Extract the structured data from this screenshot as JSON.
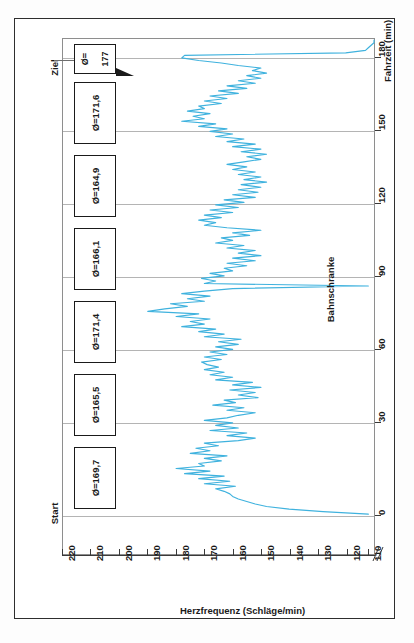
{
  "chart_data": {
    "type": "line",
    "title": "",
    "orientation": "rotated-90ccw",
    "xlabel": "Fahrzeit (min)",
    "ylabel": "Herzfrequenz (Schläge/min)",
    "xlim": [
      0,
      190
    ],
    "ylim": [
      110,
      220
    ],
    "xticks": [
      0,
      30,
      60,
      90,
      120,
      150,
      180
    ],
    "xtick_labels": [
      "0",
      "30",
      "60",
      "90",
      "120",
      "150",
      "180"
    ],
    "yticks": [
      220,
      210,
      200,
      190,
      180,
      170,
      160,
      150,
      140,
      130,
      120,
      110
    ],
    "ytick_labels": [
      "220",
      "210",
      "200",
      "190",
      "180",
      "170",
      "160",
      "150",
      "140",
      "130",
      "120",
      "110"
    ],
    "grid": "on x (Fahrzeit) gridlines only",
    "legend": "none",
    "axis_break": "y-axis broken below 110",
    "series": [
      {
        "name": "Herzfrequenz",
        "color": "#3fb2de",
        "x": [
          0,
          1,
          2,
          3,
          4,
          5,
          6,
          7,
          8,
          9,
          10,
          11,
          12,
          13,
          14,
          15,
          16,
          17,
          18,
          19,
          20,
          21,
          22,
          23,
          24,
          25,
          26,
          27,
          28,
          29,
          30,
          31,
          32,
          33,
          34,
          35,
          36,
          37,
          38,
          39,
          40,
          41,
          42,
          43,
          44,
          45,
          46,
          47,
          48,
          49,
          50,
          51,
          52,
          53,
          54,
          55,
          56,
          57,
          58,
          59,
          60,
          61,
          62,
          63,
          64,
          65,
          66,
          67,
          68,
          69,
          70,
          71,
          72,
          73,
          74,
          75,
          76,
          77,
          78,
          79,
          80,
          81,
          82,
          83,
          84,
          85,
          86,
          87,
          88,
          89,
          90,
          91,
          92,
          93,
          94,
          95,
          96,
          97,
          98,
          99,
          100,
          101,
          102,
          103,
          104,
          105,
          106,
          107,
          108,
          109,
          110,
          111,
          112,
          113,
          114,
          115,
          116,
          117,
          118,
          119,
          120,
          121,
          122,
          123,
          124,
          125,
          126,
          127,
          128,
          129,
          130,
          131,
          132,
          133,
          134,
          135,
          136,
          137,
          138,
          139,
          140,
          141,
          142,
          143,
          144,
          145,
          146,
          147,
          148,
          149,
          150,
          151,
          152,
          153,
          154,
          155,
          156,
          157,
          158,
          159,
          160,
          161,
          162,
          163,
          164,
          165,
          166,
          167,
          168,
          169,
          170,
          171,
          172,
          173,
          174,
          175,
          176,
          177,
          178,
          179,
          180,
          181,
          182,
          183,
          184,
          185,
          186,
          187
        ],
        "values": [
          112,
          128,
          140,
          148,
          152,
          155,
          158,
          160,
          161,
          163,
          166,
          159,
          170,
          161,
          172,
          163,
          177,
          168,
          180,
          170,
          172,
          164,
          170,
          162,
          175,
          168,
          173,
          165,
          170,
          158,
          152,
          162,
          155,
          168,
          158,
          166,
          160,
          170,
          162,
          158,
          152,
          162,
          156,
          167,
          159,
          163,
          151,
          158,
          152,
          161,
          150,
          160,
          153,
          166,
          160,
          168,
          163,
          170,
          165,
          169,
          171,
          164,
          170,
          162,
          168,
          160,
          166,
          158,
          165,
          157,
          170,
          163,
          172,
          166,
          178,
          170,
          175,
          168,
          180,
          172,
          190,
          184,
          176,
          182,
          170,
          176,
          168,
          178,
          170,
          160,
          112,
          170,
          166,
          171,
          163,
          168,
          160,
          163,
          155,
          162,
          152,
          160,
          150,
          158,
          152,
          162,
          156,
          166,
          160,
          164,
          154,
          160,
          150,
          162,
          170,
          166,
          172,
          164,
          170,
          160,
          168,
          158,
          166,
          156,
          163,
          152,
          160,
          151,
          158,
          150,
          157,
          148,
          156,
          150,
          158,
          152,
          160,
          155,
          162,
          156,
          150,
          155,
          148,
          157,
          150,
          160,
          152,
          162,
          156,
          166,
          160,
          168,
          162,
          172,
          166,
          178,
          170,
          174,
          168,
          176,
          170,
          172,
          164,
          170,
          162,
          168,
          158,
          165,
          155,
          162,
          152,
          158,
          150,
          155,
          148,
          153,
          150,
          158,
          164,
          172,
          178,
          177,
          120,
          113,
          112,
          111,
          110,
          110
        ]
      }
    ],
    "annotations": [
      {
        "name": "start",
        "text": "Start",
        "at_x": 0
      },
      {
        "name": "ziel",
        "text": "Ziel",
        "at_x": 182
      },
      {
        "name": "bahnschranke",
        "text": "Bahnschranke",
        "at_x": 90
      }
    ],
    "section_averages": [
      {
        "label": "Ø=169,7",
        "from": 0,
        "to": 30
      },
      {
        "label": "Ø=165,5",
        "from": 30,
        "to": 60
      },
      {
        "label": "Ø=171,4",
        "from": 60,
        "to": 90
      },
      {
        "label": "Ø=166,1",
        "from": 90,
        "to": 120
      },
      {
        "label": "Ø=164,9",
        "from": 120,
        "to": 150
      },
      {
        "label": "Ø=171,6",
        "from": 150,
        "to": 180
      }
    ],
    "goal_average": {
      "line1": "Ø=",
      "line2": "177"
    }
  },
  "axes": {
    "x": {
      "title": "Fahrzeit (min)",
      "ticks": [
        "0",
        "30",
        "60",
        "90",
        "120",
        "150",
        "180"
      ]
    },
    "y": {
      "title": "Herzfrequenz (Schläge/min)",
      "ticks": [
        "220",
        "210",
        "200",
        "190",
        "180",
        "170",
        "160",
        "150",
        "140",
        "130",
        "120",
        "110"
      ]
    }
  },
  "labels": {
    "start": "Start",
    "ziel": "Ziel",
    "bahnschranke": "Bahnschranke"
  },
  "boxes": [
    {
      "label": "Ø=171,6"
    },
    {
      "label": "Ø=164,9"
    },
    {
      "label": "Ø=166,1"
    },
    {
      "label": "Ø=171,4"
    },
    {
      "label": "Ø=165,5"
    },
    {
      "label": "Ø=169,7"
    }
  ],
  "goal_box": {
    "line1": "Ø=",
    "line2": "177"
  },
  "colors": {
    "series": "#3fb2de",
    "grid": "#b4b4b4",
    "frame": "#8e8e8e",
    "text": "#1a1a1a",
    "page_border": "#2e2e2e"
  }
}
